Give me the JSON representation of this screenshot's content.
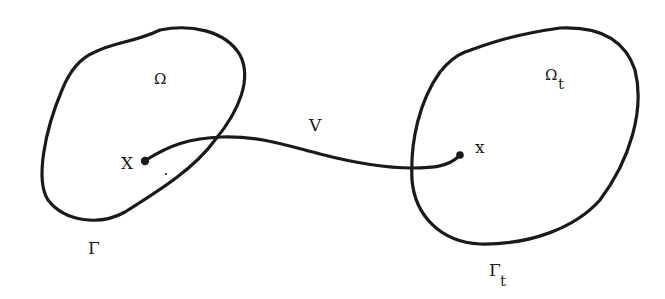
{
  "diagram": {
    "type": "domain-mapping",
    "regions": [
      {
        "id": "reference-domain",
        "interior_label": "Ω",
        "boundary_label": "Γ",
        "boundary_subscript": "",
        "point_label": "X"
      },
      {
        "id": "deformed-domain",
        "interior_label": "Ω",
        "interior_subscript": "t",
        "boundary_label": "Γ",
        "boundary_subscript": "t",
        "point_label": "x"
      }
    ],
    "mapping": {
      "label": "V",
      "from": "X",
      "to": "x"
    }
  },
  "labels": {
    "omega": "Ω",
    "gamma": "Γ",
    "omega_t": "Ω",
    "gamma_t": "Γ",
    "subscript_t": "t",
    "X": "X",
    "x": "x",
    "V": "V"
  }
}
